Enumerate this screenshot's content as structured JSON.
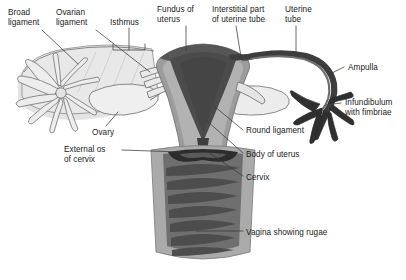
{
  "figure": {
    "background_color": "#ffffff",
    "label_color": "#1a1a1a",
    "leader_color": "#3a3a3a"
  },
  "palette": {
    "broad_ligament": "#e6e6e6",
    "broad_ligament_shadow": "#d2d2d2",
    "ovary_fill": "#ececec",
    "outline": "#6e6e6e",
    "myometrium": "#9a9a9a",
    "myometrium_light": "#b4b4b4",
    "uterine_cavity": "#4a4a4a",
    "fundus_dark": "#555555",
    "tube_dark": "#3c3c3c",
    "vagina_wall": "#a8a8a8",
    "vagina_canal": "#707070",
    "rugae": "#4f4f4f",
    "external_os": "#2e2e2e"
  },
  "labels": [
    {
      "id": "broad-ligament",
      "text": "Broad\nligament",
      "x": 8,
      "y": 8,
      "align": "left"
    },
    {
      "id": "ovarian-ligament",
      "text": "Ovarian\nligament",
      "x": 56,
      "y": 8,
      "align": "left"
    },
    {
      "id": "isthmus",
      "text": "Isthmus",
      "x": 110,
      "y": 18,
      "align": "left"
    },
    {
      "id": "fundus-of-uterus",
      "text": "Fundus of\nuterus",
      "x": 157,
      "y": 5,
      "align": "left"
    },
    {
      "id": "interstitial-part",
      "text": "Interstitial part\nof uterine tube",
      "x": 212,
      "y": 5,
      "align": "left"
    },
    {
      "id": "uterine-tube",
      "text": "Uterine\ntube",
      "x": 285,
      "y": 5,
      "align": "left"
    },
    {
      "id": "ampulla",
      "text": "Ampulla",
      "x": 348,
      "y": 63,
      "align": "left"
    },
    {
      "id": "infundibulum",
      "text": "Infundibulum\nwith fimbriae",
      "x": 345,
      "y": 98,
      "align": "left"
    },
    {
      "id": "round-ligament",
      "text": "Round ligament",
      "x": 246,
      "y": 126,
      "align": "left"
    },
    {
      "id": "body-of-uterus",
      "text": "Body of uterus",
      "x": 246,
      "y": 150,
      "align": "left"
    },
    {
      "id": "cervix",
      "text": "Cervix",
      "x": 246,
      "y": 173,
      "align": "left"
    },
    {
      "id": "ovary",
      "text": "Ovary",
      "x": 92,
      "y": 128,
      "align": "left"
    },
    {
      "id": "external-os",
      "text": "External os\nof cervix",
      "x": 64,
      "y": 145,
      "align": "left"
    },
    {
      "id": "vagina-showing-rugae",
      "text": "Vagina showing rugae",
      "x": 246,
      "y": 228,
      "align": "left"
    }
  ],
  "structures": [
    "broad ligament",
    "ovarian ligament",
    "isthmus",
    "fundus of uterus",
    "interstitial part of uterine tube",
    "uterine tube",
    "ampulla",
    "infundibulum with fimbriae",
    "round ligament",
    "body of uterus",
    "cervix",
    "ovary",
    "external os of cervix",
    "vagina showing rugae"
  ]
}
